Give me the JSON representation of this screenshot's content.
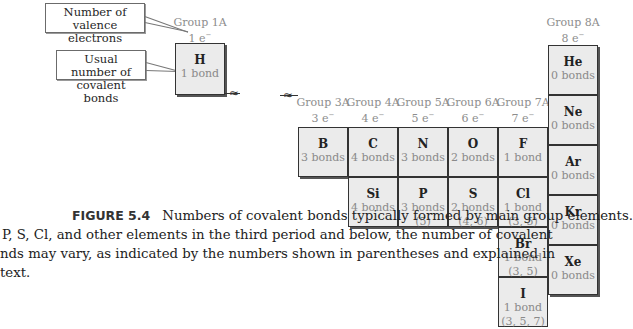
{
  "callouts": {
    "valence": "Number of valence electrons",
    "bonds": "Usual number of covalent bonds"
  },
  "groups": {
    "g1": {
      "label": "Group 1A",
      "electrons": "1 e",
      "charge": "−"
    },
    "g3": {
      "label": "Group 3A",
      "electrons": "3 e",
      "charge": "−"
    },
    "g4": {
      "label": "Group 4A",
      "electrons": "4 e",
      "charge": "−"
    },
    "g5": {
      "label": "Group 5A",
      "electrons": "5 e",
      "charge": "−"
    },
    "g6": {
      "label": "Group 6A",
      "electrons": "6 e",
      "charge": "−"
    },
    "g7": {
      "label": "Group 7A",
      "electrons": "7 e",
      "charge": "−"
    },
    "g8": {
      "label": "Group 8A",
      "electrons": "8 e",
      "charge": "−"
    }
  },
  "elements": {
    "H": {
      "symbol": "H",
      "bonds": "1 bond",
      "alt": ""
    },
    "He": {
      "symbol": "He",
      "bonds": "0 bonds",
      "alt": ""
    },
    "B": {
      "symbol": "B",
      "bonds": "3 bonds",
      "alt": ""
    },
    "C": {
      "symbol": "C",
      "bonds": "4 bonds",
      "alt": ""
    },
    "N": {
      "symbol": "N",
      "bonds": "3 bonds",
      "alt": ""
    },
    "O": {
      "symbol": "O",
      "bonds": "2 bonds",
      "alt": ""
    },
    "F": {
      "symbol": "F",
      "bonds": "1 bond",
      "alt": ""
    },
    "Ne": {
      "symbol": "Ne",
      "bonds": "0 bonds",
      "alt": ""
    },
    "Si": {
      "symbol": "Si",
      "bonds": "4 bonds",
      "alt": ""
    },
    "P": {
      "symbol": "P",
      "bonds": "3 bonds",
      "alt": "(5)"
    },
    "S": {
      "symbol": "S",
      "bonds": "2 bonds",
      "alt": "(4, 6)"
    },
    "Cl": {
      "symbol": "Cl",
      "bonds": "1 bond",
      "alt": "(3, 5)"
    },
    "Ar": {
      "symbol": "Ar",
      "bonds": "0 bonds",
      "alt": ""
    },
    "Br": {
      "symbol": "Br",
      "bonds": "1 bond",
      "alt": "(3, 5)"
    },
    "Kr": {
      "symbol": "Kr",
      "bonds": "0 bonds",
      "alt": ""
    },
    "I": {
      "symbol": "I",
      "bonds": "1 bond",
      "alt": "(3, 5, 7)"
    },
    "Xe": {
      "symbol": "Xe",
      "bonds": "0 bonds",
      "alt": ""
    }
  },
  "caption": {
    "label": "FIGURE 5.4",
    "line1": "Numbers of covalent bonds typically formed by main group elements.",
    "line2": "P, S, Cl, and other elements in the third period and below, the number of covalent",
    "line3": "nds may vary, as indicated by the numbers shown in parentheses and explained in",
    "line4": "text."
  }
}
